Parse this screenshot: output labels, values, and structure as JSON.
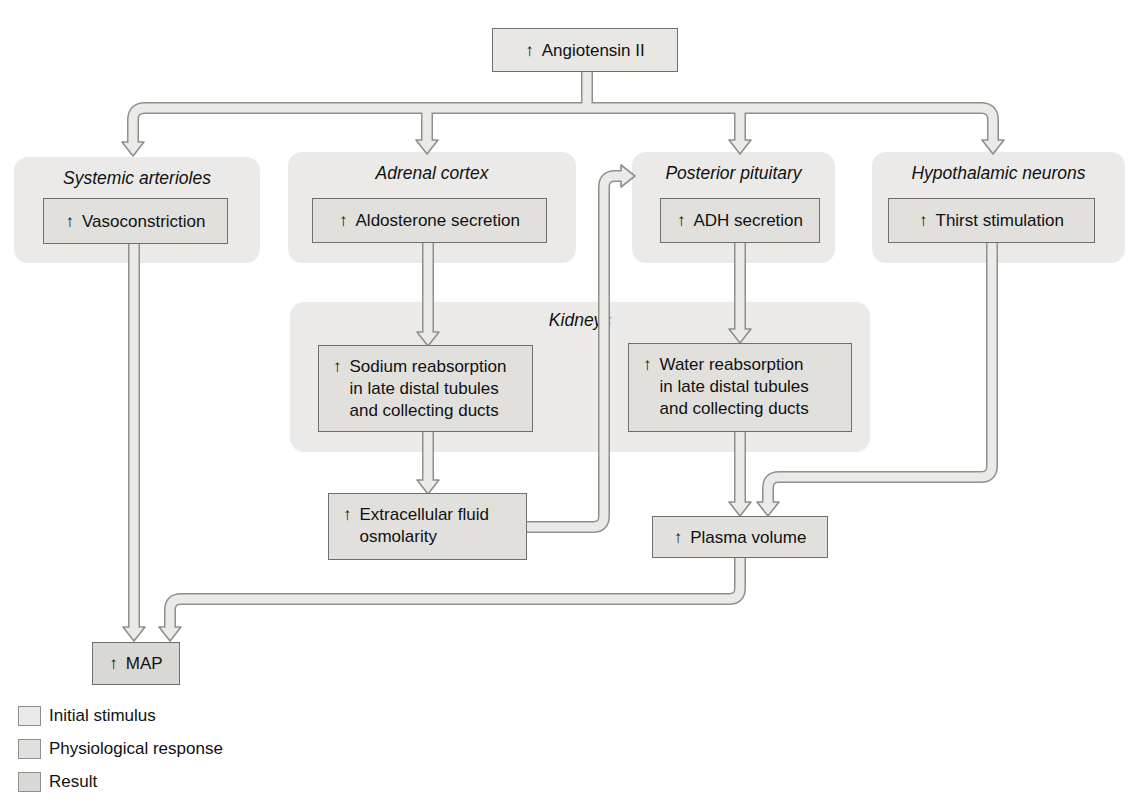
{
  "glyph": {
    "up": "↑"
  },
  "boxes": {
    "angiotensin": {
      "label": "Angiotensin II"
    },
    "vasoconstriction": {
      "label": "Vasoconstriction"
    },
    "aldosterone": {
      "label": "Aldosterone secretion"
    },
    "adh": {
      "label": "ADH secretion"
    },
    "thirst": {
      "label": "Thirst stimulation"
    },
    "sodium": {
      "line1": "Sodium reabsorption",
      "line2": "in late distal tubules",
      "line3": "and collecting ducts"
    },
    "water": {
      "line1": "Water reabsorption",
      "line2": "in late distal tubules",
      "line3": "and collecting ducts"
    },
    "ecf": {
      "line1": "Extracellular fluid",
      "line2": "osmolarity"
    },
    "plasma": {
      "label": "Plasma volume"
    },
    "map": {
      "label": "MAP"
    }
  },
  "headings": {
    "systemic_arterioles": "Systemic arterioles",
    "adrenal_cortex": "Adrenal cortex",
    "posterior_pituitary": "Posterior pituitary",
    "hypothalamic_neurons": "Hypothalamic neurons",
    "kidneys": "Kidneys"
  },
  "legend": {
    "items": [
      {
        "label": "Initial stimulus",
        "color": "#ebeae8"
      },
      {
        "label": "Physiological response",
        "color": "#e1e0dd"
      },
      {
        "label": "Result",
        "color": "#d9d8d4"
      }
    ]
  },
  "colors": {
    "panel_bg": "#ebeae8",
    "initial_box": "#e8e7e4",
    "response_box": "#e1e0dd",
    "result_box": "#d9d8d4",
    "box_border": "#6f6f6f",
    "arrow_outline": "#8f8f8f",
    "arrow_fill": "#eceae7",
    "text": "#111111"
  }
}
